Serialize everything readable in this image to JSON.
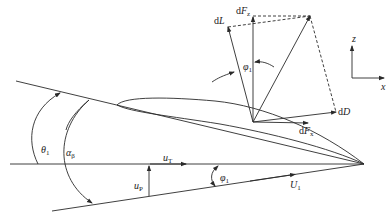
{
  "diagram": {
    "labels": {
      "dL": "dL",
      "dFz": "dF",
      "dFz_sub": "z",
      "dD": "dD",
      "dFx": "dF",
      "dFx_sub": "x",
      "phi1_top": "φ",
      "phi1_top_sub": "1",
      "theta1": "θ",
      "theta1_sub": "1",
      "alpha_beta": "α",
      "alpha_beta_sub": "β",
      "uT": "u",
      "uT_sub": "T",
      "uP": "u",
      "uP_sub": "P",
      "phi1_bottom": "φ",
      "phi1_bottom_sub": "1",
      "U1": "U",
      "U1_sub": "1",
      "axis_z": "z",
      "axis_x": "x"
    },
    "colors": {
      "line": "#2a2a2a",
      "background": "#ffffff"
    }
  }
}
